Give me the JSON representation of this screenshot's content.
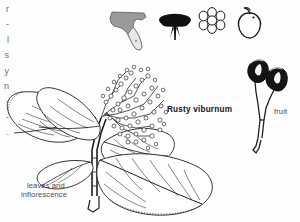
{
  "plate": {
    "title": "Rusty viburnum",
    "background_color": "#ffffff",
    "ink_color": "#1d1d1d",
    "caption_color": "#4a4a4a"
  },
  "labels": {
    "species": "Rusty viburnum",
    "leaves_caption_line1": "leaves and",
    "leaves_caption_line2": "inflorescence",
    "fruit_caption": "fruit"
  },
  "edge_text": {
    "note": "clipped column of characters at left margin",
    "glyphs": [
      "r",
      "-",
      "l",
      "s",
      "y",
      "n",
      "-",
      "-",
      "."
    ]
  },
  "icon_row": [
    {
      "name": "florida-range-map-icon",
      "label": "Florida range map",
      "fill": "#8d8d8d"
    },
    {
      "name": "inflorescence-silhouette-icon",
      "label": "inflorescence",
      "fill": "#121212"
    },
    {
      "name": "flower-icon",
      "label": "flower",
      "fill": "#ffffff"
    },
    {
      "name": "fruit-icon",
      "label": "fruit",
      "fill": "#ffffff"
    }
  ],
  "figures": [
    {
      "name": "leaves-and-inflorescence-figure",
      "label": "leaves and inflorescence"
    },
    {
      "name": "fruit-figure",
      "label": "fruit"
    }
  ]
}
